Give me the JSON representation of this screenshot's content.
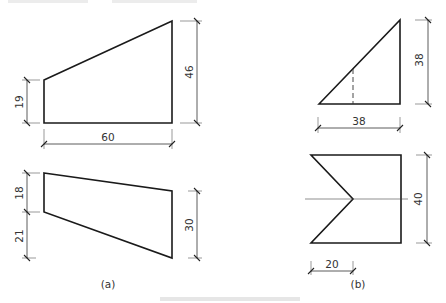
{
  "figure": {
    "panel_a": {
      "label": "(a)",
      "upper_shape": {
        "dim_left": "19",
        "dim_right": "46",
        "dim_bottom": "60"
      },
      "lower_shape": {
        "dim_left_upper": "18",
        "dim_left_lower": "21",
        "dim_right": "30"
      }
    },
    "panel_b": {
      "label": "(b)",
      "triangle": {
        "dim_right": "38",
        "dim_bottom": "38"
      },
      "notched_shape": {
        "dim_right": "40",
        "dim_bottom": "20"
      }
    }
  },
  "colors": {
    "line": "#1a1a1a",
    "text": "#333333",
    "background": "#ffffff"
  }
}
